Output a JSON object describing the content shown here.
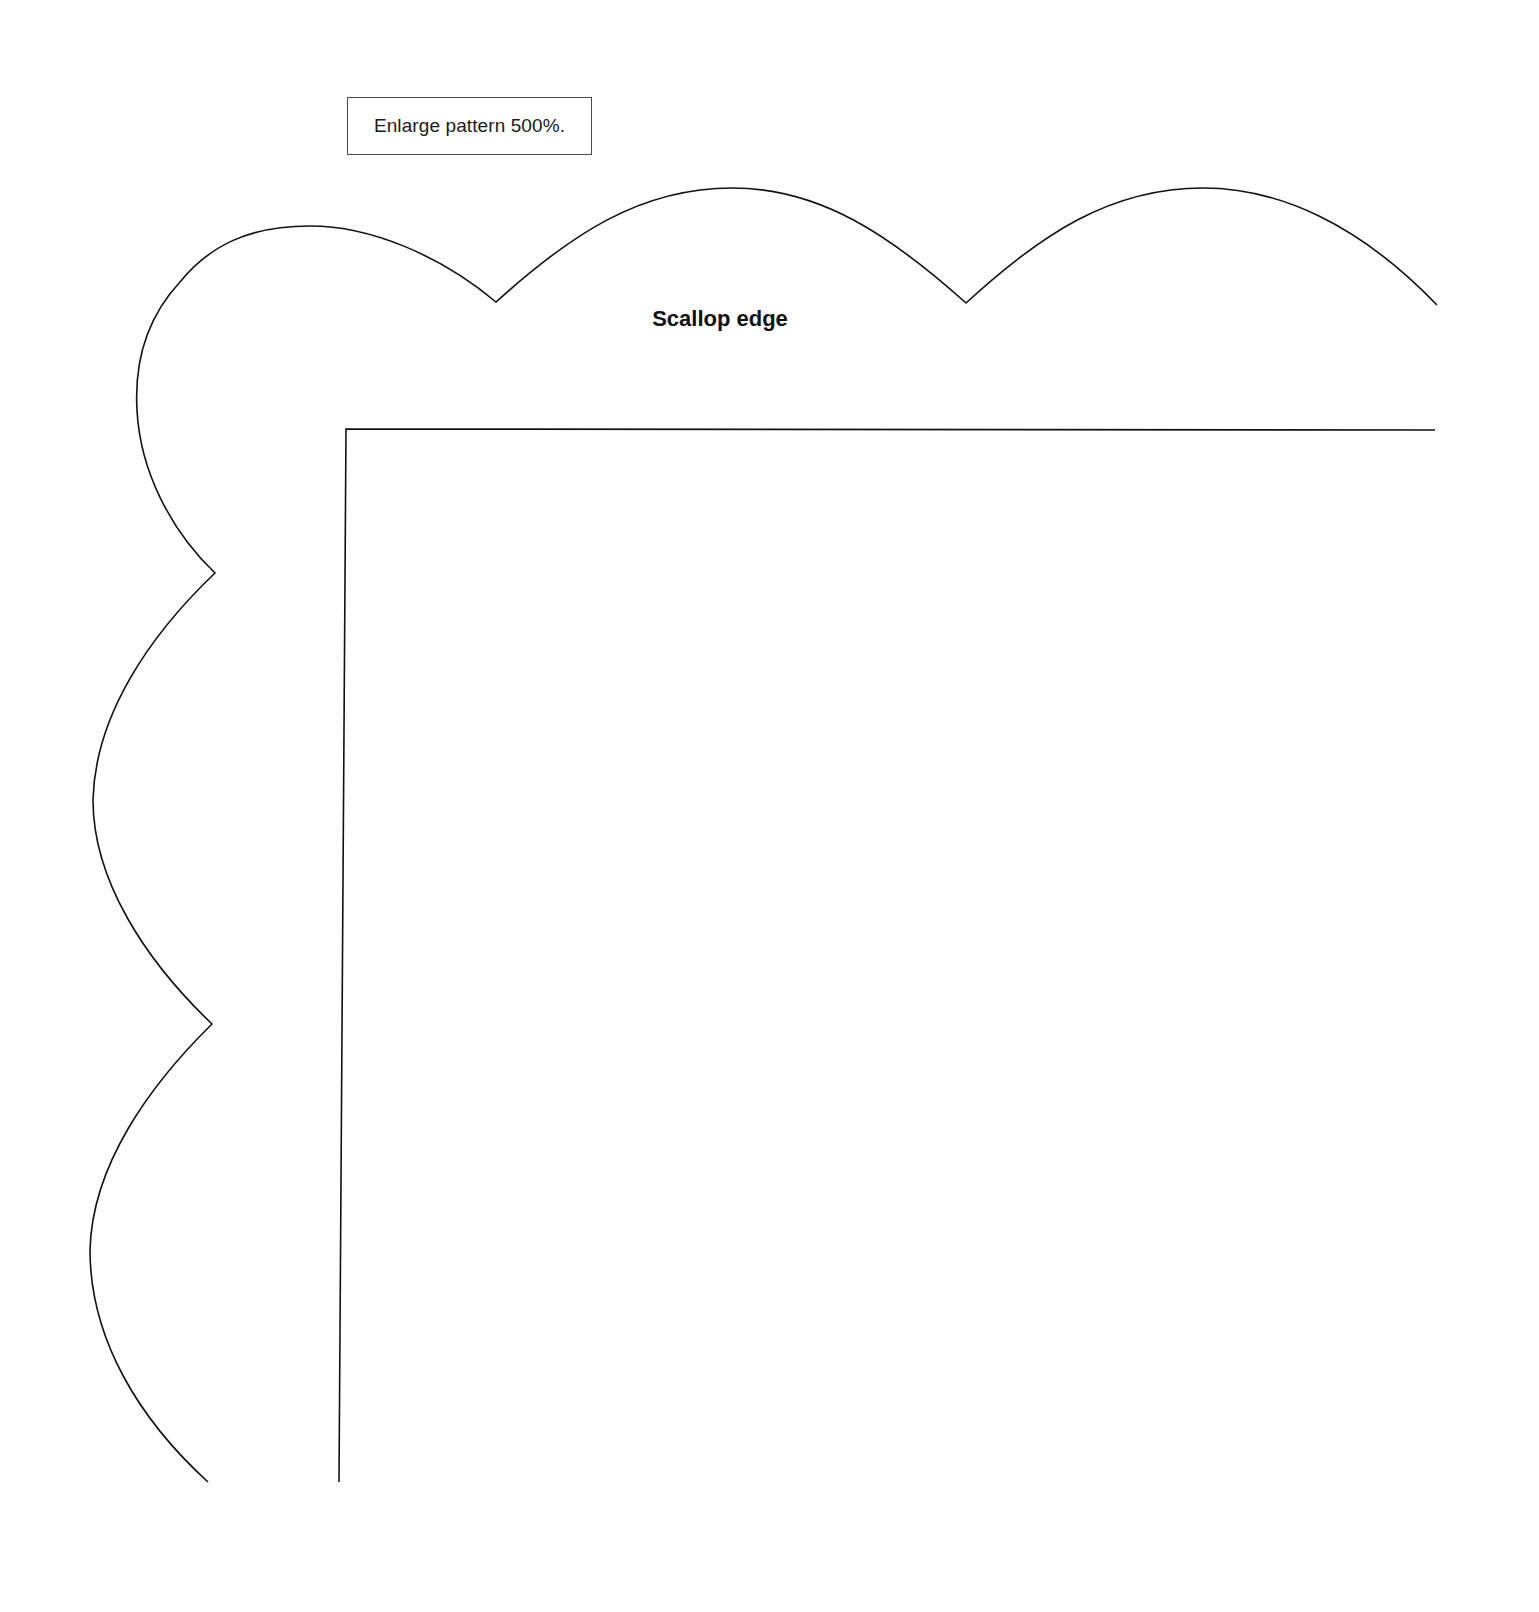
{
  "note": {
    "text": "Enlarge pattern 500%."
  },
  "labels": {
    "scallop_edge": "Scallop edge"
  },
  "colors": {
    "line": "#111111",
    "background": "#ffffff",
    "note_border": "#4a4a4a"
  },
  "pattern": {
    "type": "quilt border corner template",
    "top_scallops": 2,
    "left_scallops": 2,
    "corner_lobe": 1
  }
}
